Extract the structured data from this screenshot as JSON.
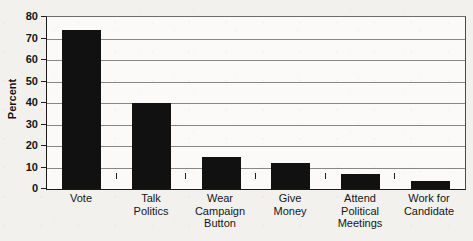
{
  "chart_data": {
    "type": "bar",
    "title": "",
    "subtitle": "",
    "xlabel": "",
    "ylabel": "Percent",
    "ylim": [
      0,
      80
    ],
    "yticks": [
      0,
      10,
      20,
      30,
      40,
      50,
      60,
      70,
      80
    ],
    "ytick_labels": [
      "0",
      "10",
      "20",
      "30",
      "40",
      "50",
      "60",
      "70",
      "80"
    ],
    "grid": "horizontal",
    "legend": "none",
    "orientation": "vertical",
    "bar_color": "#111111",
    "categories": [
      "Vote",
      "Talk Politics",
      "Wear Campaign Button",
      "Give Money",
      "Attend Political Meetings",
      "Work for Candidate"
    ],
    "category_lines": [
      [
        "Vote"
      ],
      [
        "Talk",
        "Politics"
      ],
      [
        "Wear",
        "Campaign",
        "Button"
      ],
      [
        "Give",
        "Money"
      ],
      [
        "Attend",
        "Political",
        "Meetings"
      ],
      [
        "Work for",
        "Candidate"
      ]
    ],
    "values": [
      74,
      40,
      15,
      12,
      7,
      3.5
    ]
  },
  "colors": {
    "background": "#f2f1ee",
    "plot_background": "#fbfaf8",
    "bar": "#111111",
    "gridline": "#878787",
    "axis": "#1a1a1a",
    "text": "#151515"
  }
}
